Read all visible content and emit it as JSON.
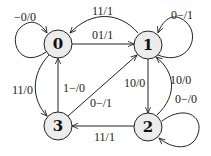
{
  "diagram": {
    "type": "finite-state-machine",
    "colors": {
      "node_fill": "#ececec",
      "stroke": "#222222"
    },
    "nodes": [
      {
        "id": "0",
        "label": "0"
      },
      {
        "id": "1",
        "label": "1"
      },
      {
        "id": "2",
        "label": "2"
      },
      {
        "id": "3",
        "label": "3"
      }
    ],
    "edges": [
      {
        "id": "e00",
        "from": "0",
        "to": "0",
        "label": "−0/0"
      },
      {
        "id": "e10",
        "from": "1",
        "to": "0",
        "label": "11/1"
      },
      {
        "id": "e01",
        "from": "0",
        "to": "1",
        "label": "01/1"
      },
      {
        "id": "e11",
        "from": "1",
        "to": "1",
        "label": "0−/1"
      },
      {
        "id": "e03",
        "from": "0",
        "to": "3",
        "label": "11/0"
      },
      {
        "id": "e30",
        "from": "3",
        "to": "0",
        "label": "1−/0"
      },
      {
        "id": "e31",
        "from": "3",
        "to": "1",
        "label": "0−/1"
      },
      {
        "id": "e12",
        "from": "1",
        "to": "2",
        "label": "10/0"
      },
      {
        "id": "e21",
        "from": "2",
        "to": "1",
        "label": "10/0"
      },
      {
        "id": "e22",
        "from": "2",
        "to": "2",
        "label": "0−/0"
      },
      {
        "id": "e23",
        "from": "2",
        "to": "3",
        "label": "11/1"
      }
    ]
  }
}
